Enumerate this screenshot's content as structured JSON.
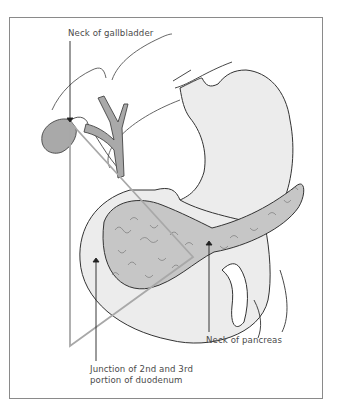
{
  "figure": {
    "type": "anatomical-illustration",
    "labels": {
      "neck_of_gallbladder": "Neck of gallbladder",
      "neck_of_pancreas": "Neck of pancreas",
      "duodenum_line1": "Junction of 2nd and 3rd",
      "duodenum_line2": "portion of duodenum"
    },
    "structures": [
      "liver-outline",
      "gallbladder",
      "cystic-duct",
      "common-bile-duct",
      "stomach",
      "duodenum",
      "pancreas",
      "triangle"
    ],
    "colors": {
      "organ_fill": "#e9e9e9",
      "organ_stroke": "#3a3a3a",
      "gallbladder_fill": "#a9a9a9",
      "pancreas_fill": "#c4c4c4",
      "triangle_stroke": "#a8a8a8",
      "frame": "#8a8a8a",
      "text": "#4a4a4a"
    }
  }
}
